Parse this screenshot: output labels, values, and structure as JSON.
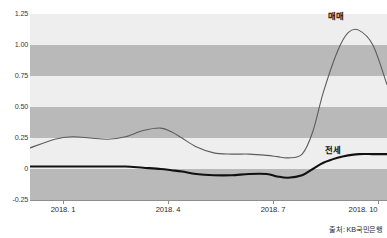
{
  "chart_data": {
    "type": "line",
    "title": "",
    "subtitle": "",
    "xlabel": "",
    "ylabel": "",
    "ylim": [
      -0.25,
      1.25
    ],
    "yticks": [
      "1.25",
      "1.00",
      "0.75",
      "0.50",
      "0.25",
      "0",
      "-0.25"
    ],
    "ytick_values": [
      1.25,
      1.0,
      0.75,
      0.5,
      0.25,
      0,
      -0.25
    ],
    "xticks": [
      "2018. 1",
      "2018. 4",
      "2018. 7",
      "2018. 10"
    ],
    "xtick_values": [
      1,
      4,
      7,
      10
    ],
    "grid": false,
    "banding": true,
    "band_colors": [
      "#eeeeee",
      "#b9b9b9"
    ],
    "legend_position": "inline-annotation",
    "x": [
      0.3,
      1.0,
      1.5,
      2.0,
      2.5,
      3.0,
      3.5,
      4.0,
      4.3,
      4.6,
      5.0,
      5.5,
      6.0,
      6.5,
      7.0,
      7.3,
      7.6,
      8.0,
      8.3,
      8.6,
      9.0,
      9.3,
      9.6,
      10.0,
      10.4
    ],
    "series": [
      {
        "name": "매매",
        "color": "#5c5c5c",
        "width": 1.1,
        "values": [
          0.17,
          0.24,
          0.26,
          0.25,
          0.24,
          0.26,
          0.31,
          0.33,
          0.3,
          0.25,
          0.18,
          0.13,
          0.12,
          0.12,
          0.11,
          0.1,
          0.09,
          0.12,
          0.3,
          0.62,
          0.95,
          1.1,
          1.12,
          1.0,
          0.68
        ]
      },
      {
        "name": "전세",
        "color": "#111111",
        "width": 2.1,
        "values": [
          0.02,
          0.02,
          0.02,
          0.02,
          0.02,
          0.02,
          0.01,
          0.0,
          -0.01,
          -0.02,
          -0.04,
          -0.05,
          -0.05,
          -0.04,
          -0.04,
          -0.06,
          -0.07,
          -0.05,
          0.0,
          0.05,
          0.09,
          0.11,
          0.12,
          0.12,
          0.12
        ]
      }
    ],
    "annotations": [
      {
        "name": "매매",
        "x": 9.3,
        "y": 1.22
      },
      {
        "name": "전세",
        "x": 9.1,
        "y": 0.18
      }
    ]
  },
  "labels": {
    "y": {
      "t125": "1.25",
      "t100": "1.00",
      "t075": "0.75",
      "t050": "0.50",
      "t025": "0.25",
      "t000": "0",
      "tm025": "-0.25"
    },
    "x": {
      "jan": "2018. 1",
      "apr": "2018. 4",
      "jul": "2018. 7",
      "oct": "2018. 10"
    },
    "series": {
      "maemae": "매매",
      "jeonse": "전세"
    }
  },
  "footer": {
    "source": "출처: KB국민은행"
  }
}
